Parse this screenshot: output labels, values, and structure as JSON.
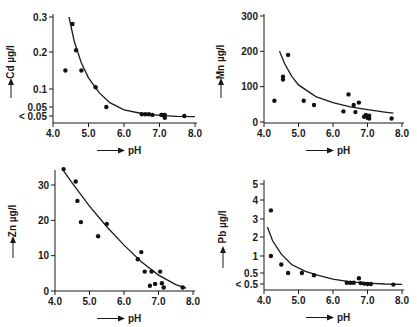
{
  "chart_data": [
    {
      "type": "scatter",
      "title": "",
      "xlabel": "pH",
      "ylabel": "Cd µg/l",
      "xlim": [
        4.0,
        8.0
      ],
      "xticks": [
        "4.0",
        "5.0",
        "6.0",
        "7.0",
        "8.0"
      ],
      "yticks": [
        "0.3",
        "0.2",
        "0.1",
        "0.05",
        "< 0.05"
      ],
      "ytick_values": [
        0.3,
        0.2,
        0.1,
        0.05,
        0.025
      ],
      "points": [
        {
          "x": 4.35,
          "y": 0.15
        },
        {
          "x": 4.55,
          "y": 0.28
        },
        {
          "x": 4.65,
          "y": 0.205
        },
        {
          "x": 4.8,
          "y": 0.15
        },
        {
          "x": 5.2,
          "y": 0.105
        },
        {
          "x": 5.5,
          "y": 0.05
        },
        {
          "x": 6.5,
          "y": 0.03
        },
        {
          "x": 6.6,
          "y": 0.03
        },
        {
          "x": 6.7,
          "y": 0.03
        },
        {
          "x": 6.8,
          "y": 0.028
        },
        {
          "x": 7.05,
          "y": 0.028
        },
        {
          "x": 7.1,
          "y": 0.028
        },
        {
          "x": 7.15,
          "y": 0.02
        },
        {
          "x": 7.15,
          "y": 0.028
        },
        {
          "x": 7.7,
          "y": 0.025
        }
      ],
      "curve": [
        {
          "x": 4.45,
          "y": 0.3
        },
        {
          "x": 4.6,
          "y": 0.23
        },
        {
          "x": 4.8,
          "y": 0.17
        },
        {
          "x": 5.0,
          "y": 0.13
        },
        {
          "x": 5.3,
          "y": 0.09
        },
        {
          "x": 5.6,
          "y": 0.062
        },
        {
          "x": 6.0,
          "y": 0.042
        },
        {
          "x": 6.5,
          "y": 0.032
        },
        {
          "x": 7.0,
          "y": 0.027
        },
        {
          "x": 7.5,
          "y": 0.024
        },
        {
          "x": 8.0,
          "y": 0.023
        }
      ]
    },
    {
      "type": "scatter",
      "title": "",
      "xlabel": "pH",
      "ylabel": "Mn µg/l",
      "xlim": [
        4.0,
        8.0
      ],
      "ylim": [
        0,
        300
      ],
      "xticks": [
        "4.0",
        "5.0",
        "6.0",
        "7.0",
        "8.0"
      ],
      "yticks": [
        "300",
        "200",
        "100",
        "0"
      ],
      "ytick_values": [
        300,
        200,
        100,
        0
      ],
      "points": [
        {
          "x": 4.3,
          "y": 60
        },
        {
          "x": 4.55,
          "y": 120
        },
        {
          "x": 4.55,
          "y": 128
        },
        {
          "x": 4.7,
          "y": 190
        },
        {
          "x": 5.15,
          "y": 60
        },
        {
          "x": 5.45,
          "y": 48
        },
        {
          "x": 6.3,
          "y": 30
        },
        {
          "x": 6.45,
          "y": 78
        },
        {
          "x": 6.6,
          "y": 48
        },
        {
          "x": 6.65,
          "y": 28
        },
        {
          "x": 6.75,
          "y": 55
        },
        {
          "x": 6.9,
          "y": 15
        },
        {
          "x": 6.95,
          "y": 20
        },
        {
          "x": 7.0,
          "y": 12
        },
        {
          "x": 7.05,
          "y": 18
        },
        {
          "x": 7.05,
          "y": 10
        },
        {
          "x": 7.7,
          "y": 10
        }
      ],
      "curve": [
        {
          "x": 4.45,
          "y": 200
        },
        {
          "x": 4.6,
          "y": 165
        },
        {
          "x": 4.8,
          "y": 130
        },
        {
          "x": 5.0,
          "y": 105
        },
        {
          "x": 5.5,
          "y": 72
        },
        {
          "x": 6.0,
          "y": 55
        },
        {
          "x": 6.5,
          "y": 43
        },
        {
          "x": 7.0,
          "y": 35
        },
        {
          "x": 7.5,
          "y": 28
        },
        {
          "x": 7.75,
          "y": 25
        }
      ]
    },
    {
      "type": "scatter",
      "title": "",
      "xlabel": "pH",
      "ylabel": "Zn µg/l",
      "xlim": [
        4.0,
        8.0
      ],
      "ylim": [
        0,
        35
      ],
      "xticks": [
        "4.0",
        "5.0",
        "6.0",
        "7.0",
        "8.0"
      ],
      "yticks": [
        "30",
        "20",
        "10",
        "0"
      ],
      "ytick_values": [
        30,
        20,
        10,
        0
      ],
      "points": [
        {
          "x": 4.25,
          "y": 34.5
        },
        {
          "x": 4.6,
          "y": 31
        },
        {
          "x": 4.65,
          "y": 25.5
        },
        {
          "x": 4.75,
          "y": 19.5
        },
        {
          "x": 5.25,
          "y": 15.5
        },
        {
          "x": 5.5,
          "y": 19
        },
        {
          "x": 6.4,
          "y": 9
        },
        {
          "x": 6.5,
          "y": 11
        },
        {
          "x": 6.6,
          "y": 5.5
        },
        {
          "x": 6.75,
          "y": 1.5
        },
        {
          "x": 6.8,
          "y": 5.5
        },
        {
          "x": 6.9,
          "y": 2
        },
        {
          "x": 7.05,
          "y": 5.5
        },
        {
          "x": 7.1,
          "y": 2.2
        },
        {
          "x": 7.15,
          "y": 1
        },
        {
          "x": 7.7,
          "y": 1
        }
      ],
      "curve": [
        {
          "x": 4.25,
          "y": 34
        },
        {
          "x": 4.5,
          "y": 30.5
        },
        {
          "x": 5.0,
          "y": 24
        },
        {
          "x": 5.5,
          "y": 18.2
        },
        {
          "x": 6.0,
          "y": 13
        },
        {
          "x": 6.5,
          "y": 8.3
        },
        {
          "x": 7.0,
          "y": 4.5
        },
        {
          "x": 7.5,
          "y": 1.8
        },
        {
          "x": 7.8,
          "y": 0.8
        }
      ]
    },
    {
      "type": "scatter",
      "title": "",
      "xlabel": "pH",
      "ylabel": "Pb µg/l",
      "xlim": [
        4.0,
        8.0
      ],
      "xticks": [
        "4.0",
        "5.0",
        "6.0",
        "7.0",
        "8.0"
      ],
      "yticks": [
        "5",
        "4",
        "3",
        "2",
        "1",
        "0.5",
        "< 0.5"
      ],
      "ytick_values": [
        5,
        4,
        3,
        2,
        1,
        0.5,
        0.25
      ],
      "points": [
        {
          "x": 4.2,
          "y": 3.45
        },
        {
          "x": 4.2,
          "y": 1.0
        },
        {
          "x": 4.5,
          "y": 0.75
        },
        {
          "x": 4.7,
          "y": 0.5
        },
        {
          "x": 5.1,
          "y": 0.5
        },
        {
          "x": 5.45,
          "y": 0.45
        },
        {
          "x": 6.4,
          "y": 0.28
        },
        {
          "x": 6.5,
          "y": 0.28
        },
        {
          "x": 6.6,
          "y": 0.28
        },
        {
          "x": 6.75,
          "y": 0.38
        },
        {
          "x": 6.8,
          "y": 0.27
        },
        {
          "x": 6.9,
          "y": 0.26
        },
        {
          "x": 7.0,
          "y": 0.25
        },
        {
          "x": 7.1,
          "y": 0.25
        },
        {
          "x": 7.75,
          "y": 0.23
        }
      ],
      "curve": [
        {
          "x": 4.1,
          "y": 2.55
        },
        {
          "x": 4.25,
          "y": 1.8
        },
        {
          "x": 4.5,
          "y": 1.1
        },
        {
          "x": 4.8,
          "y": 0.75
        },
        {
          "x": 5.2,
          "y": 0.55
        },
        {
          "x": 5.6,
          "y": 0.44
        },
        {
          "x": 6.0,
          "y": 0.36
        },
        {
          "x": 6.5,
          "y": 0.3
        },
        {
          "x": 7.0,
          "y": 0.27
        },
        {
          "x": 7.5,
          "y": 0.25
        },
        {
          "x": 8.0,
          "y": 0.24
        }
      ]
    }
  ]
}
